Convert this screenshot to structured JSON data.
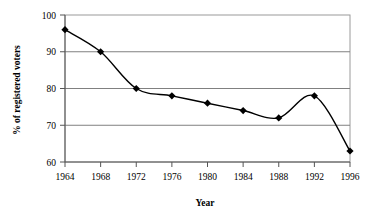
{
  "chart_data": {
    "type": "line",
    "title": "",
    "xlabel": "Year",
    "ylabel": "% of registered voters",
    "x": [
      1964,
      1968,
      1972,
      1976,
      1980,
      1984,
      1988,
      1992,
      1996
    ],
    "values": [
      96,
      90,
      80,
      78,
      76,
      74,
      72,
      78,
      63
    ],
    "series": [
      {
        "name": "% of registered voters",
        "values": [
          96,
          90,
          80,
          78,
          76,
          74,
          72,
          78,
          63
        ]
      }
    ],
    "xtick_labels": [
      "1964",
      "1968",
      "1972",
      "1976",
      "1980",
      "1984",
      "1988",
      "1992",
      "1996"
    ],
    "ytick_labels": [
      "60",
      "70",
      "80",
      "90",
      "100"
    ],
    "yticks": [
      60,
      70,
      80,
      90,
      100
    ],
    "ylim": [
      60,
      100
    ],
    "xlim": [
      1964,
      1996
    ],
    "grid": "horizontal",
    "legend": "none",
    "marker": "diamond",
    "line_color": "#000000",
    "marker_color": "#000000",
    "grid_color": "#808080",
    "frame_color": "#999999",
    "background": "#ffffff"
  }
}
